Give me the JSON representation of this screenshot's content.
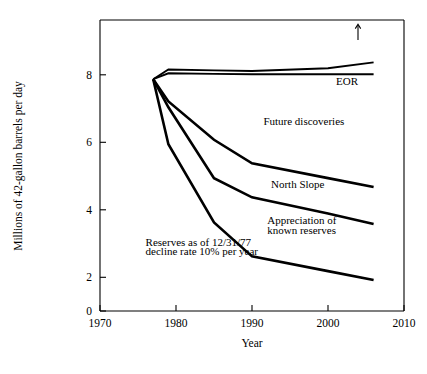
{
  "chart_data": {
    "type": "line",
    "title": "",
    "xlabel": "Year",
    "ylabel": "Millions of 42-gallon barrels per day",
    "xlim": [
      1970,
      2010
    ],
    "ylim": [
      0,
      8.6
    ],
    "xticks": [
      1970,
      1980,
      1990,
      2000,
      2010
    ],
    "yticks": [
      0,
      2,
      4,
      6,
      8
    ],
    "xtick_labels": [
      "1970",
      "1980",
      "1990",
      "2000",
      "2010"
    ],
    "ytick_labels": [
      "0",
      "2",
      "4",
      "6",
      "8"
    ],
    "grid": false,
    "legend": "none",
    "series": [
      {
        "name": "Total including EOR",
        "x": [
          1977,
          1979,
          1985,
          1990,
          2000,
          2006
        ],
        "values": [
          7.85,
          8.18,
          8.15,
          8.13,
          8.22,
          8.42
        ]
      },
      {
        "name": "Total excluding EOR",
        "x": [
          1977,
          1979,
          1985,
          1990,
          2000,
          2006
        ],
        "values": [
          7.85,
          8.05,
          8.03,
          8.02,
          8.02,
          8.02
        ]
      },
      {
        "name": "Future discoveries boundary",
        "x": [
          1977,
          1979,
          1985,
          1990,
          2000,
          2006
        ],
        "values": [
          7.85,
          7.1,
          5.8,
          5.0,
          4.5,
          4.2
        ]
      },
      {
        "name": "North Slope boundary",
        "x": [
          1977,
          1979,
          1985,
          1990,
          2000,
          2006
        ],
        "values": [
          7.85,
          6.9,
          4.5,
          3.85,
          3.3,
          2.95
        ]
      },
      {
        "name": "Appreciation of known reserves boundary",
        "x": [
          1977,
          1979,
          1985,
          1990,
          2000,
          2006
        ],
        "values": [
          7.85,
          5.65,
          3.0,
          1.85,
          1.35,
          1.05
        ]
      }
    ],
    "annotations": [
      {
        "id": "eor",
        "text": "EOR",
        "x": 2002.5,
        "y": 7.65
      },
      {
        "id": "future-discoveries",
        "text": "Future discoveries",
        "x": 1991.5,
        "y": 6.3
      },
      {
        "id": "north-slope",
        "text": "North Slope",
        "x": 1992.5,
        "y": 4.18
      },
      {
        "id": "appreciation-line1",
        "text": "Appreciation of",
        "x": 1992.0,
        "y": 2.95
      },
      {
        "id": "appreciation-line2",
        "text": "known reserves",
        "x": 1992.0,
        "y": 2.62
      },
      {
        "id": "reserves-line1",
        "text": "Reserves as of 12/31/77",
        "x": 1976.0,
        "y": 2.2
      },
      {
        "id": "reserves-line2",
        "text": "decline rate 10% per year",
        "x": 1976.0,
        "y": 1.88
      }
    ]
  },
  "axis": {
    "x_title": "Year",
    "y_title": "Millions of 42-gallon barrels per day"
  },
  "colors": {
    "line": "#000000",
    "axis": "#000000",
    "background": "#ffffff"
  }
}
